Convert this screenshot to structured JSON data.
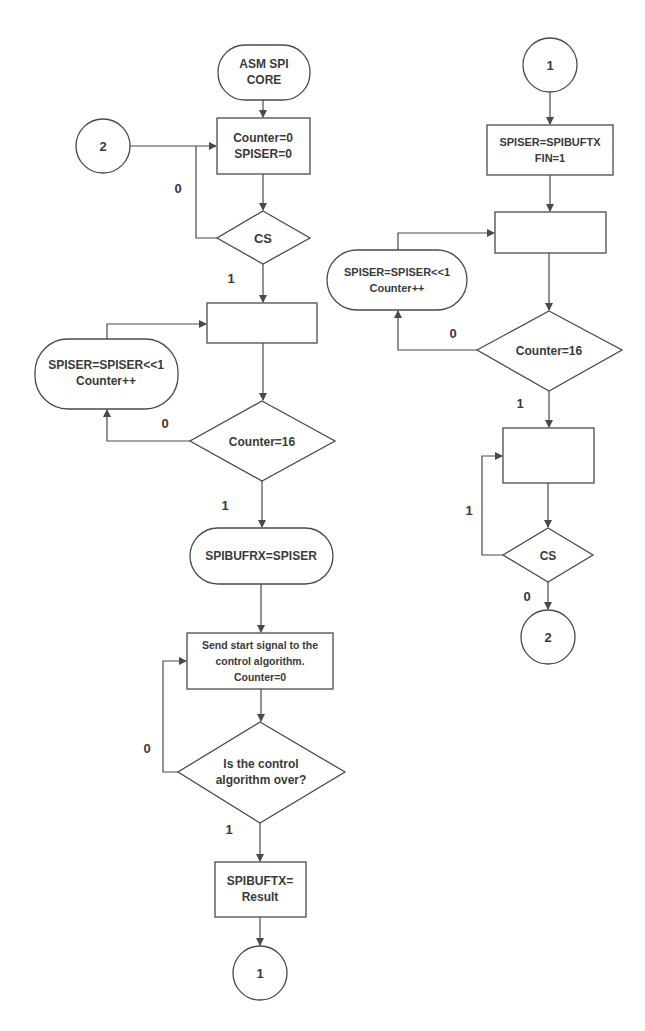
{
  "diagram": {
    "left_flow": {
      "start": {
        "lines": [
          "ASM SPI",
          "CORE"
        ]
      },
      "connector_in": {
        "label": "2"
      },
      "init_box": {
        "lines": [
          "Counter=0",
          "SPISER=0"
        ]
      },
      "cs_decision": {
        "label": "CS",
        "no_label": "0",
        "yes_label": "1"
      },
      "wait_box": {
        "lines": []
      },
      "shift_op": {
        "lines": [
          "SPISER=SPISER<<1",
          "Counter++"
        ]
      },
      "counter_decision": {
        "label": "Counter=16",
        "no_label": "0",
        "yes_label": "1"
      },
      "store_rx": {
        "lines": [
          "SPIBUFRX=SPISER"
        ]
      },
      "start_signal_box": {
        "lines": [
          "Send start signal to the",
          "control algorithm.",
          "Counter=0"
        ]
      },
      "control_decision": {
        "lines": [
          "Is the control",
          "algorithm over?"
        ],
        "no_label": "0",
        "yes_label": "1"
      },
      "result_box": {
        "lines": [
          "SPIBUFTX=",
          "Result"
        ]
      },
      "connector_out": {
        "label": "1"
      }
    },
    "right_flow": {
      "connector_in": {
        "label": "1"
      },
      "load_box": {
        "lines": [
          "SPISER=SPIBUFTX",
          "FIN=1"
        ]
      },
      "wait_box": {
        "lines": []
      },
      "shift_op": {
        "lines": [
          "SPISER=SPISER<<1",
          "Counter++"
        ]
      },
      "counter_decision": {
        "label": "Counter=16",
        "no_label": "0",
        "yes_label": "1"
      },
      "hold_box": {
        "lines": []
      },
      "cs_decision": {
        "label": "CS",
        "yes_label": "1",
        "no_label": "0"
      },
      "connector_out": {
        "label": "2"
      }
    },
    "colors": {
      "stroke": "#4a4a4a",
      "text": "#3a3a3a",
      "background": "#ffffff"
    }
  }
}
